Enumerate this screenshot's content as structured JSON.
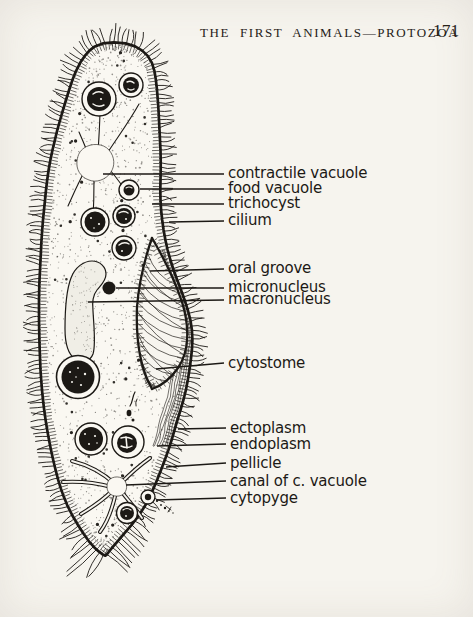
{
  "colors": {
    "ink": "#1c1915",
    "paper": "#f6f4ee"
  },
  "header": {
    "title": "THE FIRST ANIMALS—PROTOZOA",
    "page_number": "171"
  },
  "figure": {
    "type": "labeled-diagram",
    "labels": [
      {
        "text": "contractile vacuole",
        "tx": 228,
        "ty": 178,
        "x1": 103,
        "y1": 174,
        "x2": 224,
        "y2": 174
      },
      {
        "text": "food vacuole",
        "tx": 228,
        "ty": 193,
        "x1": 140,
        "y1": 189,
        "x2": 224,
        "y2": 189
      },
      {
        "text": "trichocyst",
        "tx": 228,
        "ty": 208,
        "x1": 152,
        "y1": 204,
        "x2": 224,
        "y2": 204
      },
      {
        "text": "cilium",
        "tx": 228,
        "ty": 225,
        "x1": 169,
        "y1": 222,
        "x2": 224,
        "y2": 221
      },
      {
        "text": "oral groove",
        "tx": 228,
        "ty": 273,
        "x1": 150,
        "y1": 271,
        "x2": 224,
        "y2": 269
      },
      {
        "text": "micronucleus",
        "tx": 228,
        "ty": 292,
        "x1": 116,
        "y1": 288,
        "x2": 224,
        "y2": 288
      },
      {
        "text": "macronucleus",
        "tx": 228,
        "ty": 304,
        "x1": 88,
        "y1": 302,
        "x2": 224,
        "y2": 300
      },
      {
        "text": "cytostome",
        "tx": 228,
        "ty": 368,
        "x1": 156,
        "y1": 369,
        "x2": 224,
        "y2": 363
      },
      {
        "text": "ectoplasm",
        "tx": 230,
        "ty": 433,
        "x1": 178,
        "y1": 429,
        "x2": 226,
        "y2": 428
      },
      {
        "text": "endoplasm",
        "tx": 230,
        "ty": 449,
        "x1": 157,
        "y1": 446,
        "x2": 226,
        "y2": 444
      },
      {
        "text": "pellicle",
        "tx": 230,
        "ty": 468,
        "x1": 166,
        "y1": 467,
        "x2": 226,
        "y2": 463
      },
      {
        "text": "canal of c. vacuole",
        "tx": 230,
        "ty": 486,
        "x1": 126,
        "y1": 485,
        "x2": 226,
        "y2": 481
      },
      {
        "text": "cytopyge",
        "tx": 230,
        "ty": 503,
        "x1": 156,
        "y1": 500,
        "x2": 226,
        "y2": 498
      }
    ]
  }
}
